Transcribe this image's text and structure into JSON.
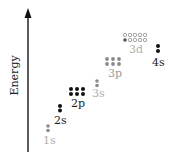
{
  "diagram": {
    "axis": {
      "label": "Energy",
      "direction": "up"
    },
    "colors": {
      "filled_dark": "#111111",
      "filled_gray": "#8a8a8a",
      "filled_light": "#b5b5b5",
      "hollow": "#9a9a9a",
      "axis": "#333333",
      "label_dark": "#222222",
      "label_gray": "#9a9a9a",
      "label_light": "#b0b0b0"
    },
    "orbitals": [
      {
        "name": "1s",
        "label": "1s",
        "tone": "gray",
        "electrons": 2,
        "capacity": 2
      },
      {
        "name": "2s",
        "label": "2s",
        "tone": "dark",
        "electrons": 2,
        "capacity": 2
      },
      {
        "name": "2p",
        "label": "2p",
        "tone": "dark",
        "electrons": 6,
        "capacity": 6
      },
      {
        "name": "3s",
        "label": "3s",
        "tone": "light",
        "electrons": 2,
        "capacity": 2
      },
      {
        "name": "3p",
        "label": "3p",
        "tone": "gray",
        "electrons": 6,
        "capacity": 6
      },
      {
        "name": "3d",
        "label": "3d",
        "tone": "light",
        "electrons": 1,
        "capacity": 10
      },
      {
        "name": "4s",
        "label": "4s",
        "tone": "dark",
        "electrons": 2,
        "capacity": 2
      }
    ]
  }
}
